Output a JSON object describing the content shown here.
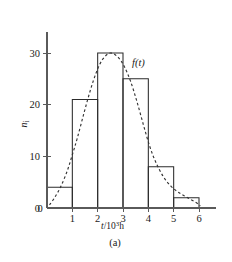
{
  "figure": {
    "caption": "(a)",
    "background_color": "#ffffff",
    "bar_stroke_color": "#2b2b2b",
    "curve_stroke_color": "#333333",
    "axis_color": "#5a5a5a"
  },
  "chart_data": {
    "type": "bar",
    "title": "",
    "subtitle": "",
    "xlabel": "t/10³h",
    "xlabel_parts": {
      "variable": "t",
      "slash": "/",
      "base": "10",
      "exponent": "3",
      "unit": "h"
    },
    "ylabel": "nᵢ",
    "ylabel_parts": {
      "variable": "n",
      "subscript": "i"
    },
    "categories": [
      "0–1",
      "1–2",
      "2–3",
      "3–4",
      "4–5",
      "5–6"
    ],
    "bin_edges": [
      0,
      1,
      2,
      3,
      4,
      5,
      6
    ],
    "values": [
      4,
      21,
      30,
      25,
      8,
      2
    ],
    "xlim": [
      0,
      6.6
    ],
    "ylim": [
      0,
      33
    ],
    "xticks": [
      0,
      1,
      2,
      3,
      4,
      5,
      6
    ],
    "xtick_labels": [
      "0",
      "1",
      "2",
      "3",
      "4",
      "5",
      "6"
    ],
    "yticks": [
      0,
      10,
      20,
      30
    ],
    "ytick_labels": [
      "0",
      "10",
      "20",
      "30"
    ],
    "grid": false,
    "legend_position": "none",
    "annotations": [
      {
        "name": "curve-label",
        "text": "f(t)",
        "x": 3.45,
        "y": 27.5
      }
    ],
    "series": [
      {
        "name": "nᵢ",
        "type": "bar",
        "values": [
          4,
          21,
          30,
          25,
          8,
          2
        ]
      },
      {
        "name": "f(t)",
        "type": "line",
        "style": "dashed",
        "x": [
          0.1,
          0.3,
          0.55,
          0.8,
          1.0,
          1.2,
          1.45,
          1.7,
          1.95,
          2.2,
          2.5,
          2.8,
          3.05,
          3.3,
          3.55,
          3.8,
          4.05,
          4.3,
          4.6,
          4.9,
          5.2,
          5.55,
          5.9,
          6.05
        ],
        "y": [
          0.6,
          2.0,
          4.2,
          7.2,
          10.3,
          13.6,
          18.2,
          22.6,
          26.3,
          28.8,
          30.0,
          29.2,
          27.4,
          24.5,
          20.6,
          16.2,
          12.0,
          8.8,
          6.0,
          4.2,
          3.0,
          2.0,
          1.0,
          0.4
        ]
      }
    ]
  }
}
